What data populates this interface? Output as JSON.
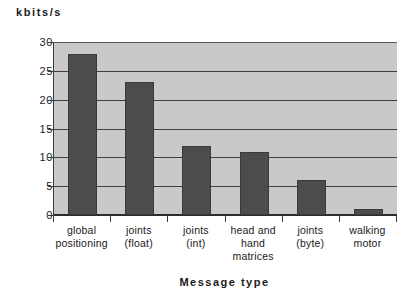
{
  "chart_data": {
    "type": "bar",
    "title": "",
    "xlabel": "Message  type",
    "ylabel": "kbits/s",
    "ylim": [
      0,
      30
    ],
    "yticks": [
      0,
      5,
      10,
      15,
      20,
      25,
      30
    ],
    "ytick_labels": [
      "0",
      "5",
      "10",
      "15",
      "20",
      "25",
      "30"
    ],
    "grid": true,
    "legend": null,
    "categories": [
      "global\npositioning",
      "joints\n(float)",
      "joints\n(int)",
      "head and\nhand\nmatrices",
      "joints\n(byte)",
      "walking\nmotor"
    ],
    "category_lines": [
      [
        "global",
        "positioning"
      ],
      [
        "joints",
        "(float)"
      ],
      [
        "joints",
        "(int)"
      ],
      [
        "head and",
        "hand",
        "matrices"
      ],
      [
        "joints",
        "(byte)"
      ],
      [
        "walking",
        "motor"
      ]
    ],
    "values": [
      28,
      23,
      12,
      11,
      6,
      1
    ],
    "colors": {
      "bar": "#4c4c4c",
      "bar_border": "#3a3a3a",
      "plot_background": "#c9c9c9",
      "gridline": "#3f3f3f",
      "axis": "#2b2b2b",
      "text": "#1a1a1a",
      "page_background": "#ffffff"
    }
  }
}
